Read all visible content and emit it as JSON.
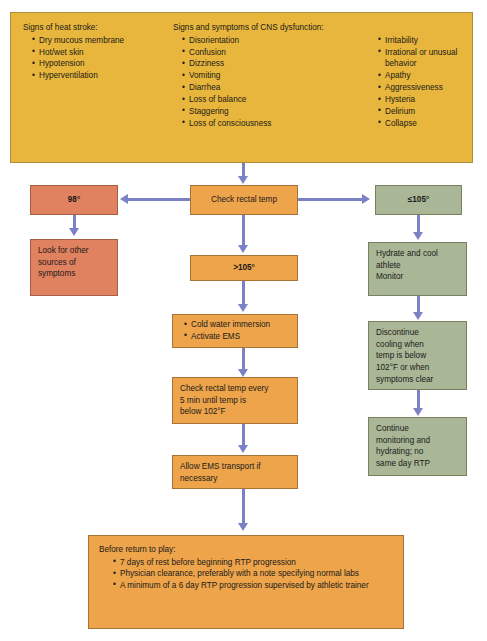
{
  "diagram": {
    "colors": {
      "yellow": "#e8b63c",
      "orange": "#eda44b",
      "salmon": "#e0815f",
      "green": "#aab797",
      "arrow": "#7b81c4"
    }
  },
  "info_panel": {
    "column1": {
      "heading": "Signs of heat stroke:",
      "items": [
        "Dry mucous membrane",
        "Hot/wet skin",
        "Hypotension",
        "Hyperventilation"
      ]
    },
    "column2": {
      "heading": "Signs and symptoms of CNS dysfunction:",
      "items": [
        "Disorientation",
        "Confusion",
        "Dizziness",
        "Vomiting",
        "Diarrhea",
        "Loss of balance",
        "Staggering",
        "Loss of consciousness"
      ]
    },
    "column3": {
      "items": [
        "Irritability",
        "Irrational or unusual behavior",
        "Apathy",
        "Aggressiveness",
        "Hysteria",
        "Delirium",
        "Collapse"
      ]
    }
  },
  "nodes": {
    "check_temp": "Check rectal temp",
    "temp_98": "98°",
    "temp_over_105": ">105°",
    "temp_le_105": "≤105°",
    "look_other": {
      "lines": [
        "Look for other",
        "sources of",
        "symptoms"
      ]
    },
    "cold_water": {
      "items": [
        "Cold water immersion",
        "Activate EMS"
      ]
    },
    "recheck": {
      "lines": [
        "Check rectal temp every",
        "5 min until temp is",
        "below 102°F"
      ]
    },
    "ems_transport": {
      "lines": [
        "Allow EMS transport if",
        "necessary"
      ]
    },
    "hydrate": {
      "lines": [
        "Hydrate and cool",
        "athlete",
        "Monitor"
      ]
    },
    "discontinue": {
      "lines": [
        "Discontinue",
        "cooling when",
        "temp is below",
        "102°F or when",
        "symptoms clear"
      ]
    },
    "continue_monitor": {
      "lines": [
        "Continue",
        "monitoring and",
        "hydrating; no",
        "same day RTP"
      ]
    },
    "return_to_play": {
      "heading": "Before return to play:",
      "items": [
        "7 days of rest before beginning RTP progression",
        "Physician clearance, preferably with a note specifying normal labs",
        "A minimum of a 6 day RTP progression supervised by athletic trainer"
      ]
    }
  }
}
